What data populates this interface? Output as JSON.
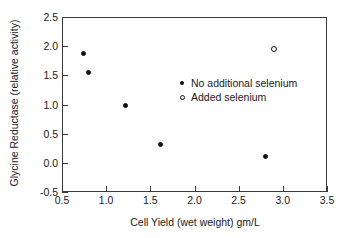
{
  "chart_data": {
    "type": "scatter",
    "title": "",
    "xlabel": "Cell Yield (wet weight) gm/L",
    "ylabel": "Glycine Reductase (relative activity)",
    "xlim": [
      0.5,
      3.5
    ],
    "ylim": [
      -0.5,
      2.5
    ],
    "xticks": [
      "0.5",
      "1.0",
      "1.5",
      "2.0",
      "2.5",
      "3.0",
      "3.5"
    ],
    "xtick_values": [
      0.5,
      1.0,
      1.5,
      2.0,
      2.5,
      3.0,
      3.5
    ],
    "yticks": [
      "-0.5",
      "0.0",
      "0.5",
      "1.0",
      "1.5",
      "2.0",
      "2.5"
    ],
    "ytick_values": [
      -0.5,
      0.0,
      0.5,
      1.0,
      1.5,
      2.0,
      2.5
    ],
    "grid": false,
    "legend_position": "center-right",
    "series": [
      {
        "name": "No additional selenium",
        "marker": "filled-circle",
        "color": "#111111",
        "points": [
          {
            "x": 0.74,
            "y": 1.87
          },
          {
            "x": 0.8,
            "y": 1.55
          },
          {
            "x": 1.22,
            "y": 0.98
          },
          {
            "x": 1.62,
            "y": 0.32
          },
          {
            "x": 2.8,
            "y": 0.11
          }
        ]
      },
      {
        "name": "Added selenium",
        "marker": "open-circle",
        "color": "#111111",
        "points": [
          {
            "x": 2.9,
            "y": 1.96
          }
        ]
      }
    ]
  },
  "legend": {
    "entries": [
      {
        "label": "No additional selenium",
        "marker": "filled-circle"
      },
      {
        "label": "Added selenium",
        "marker": "open-circle"
      }
    ]
  },
  "colors": {
    "axis": "#3a3a3a",
    "text": "#1a1a1a",
    "marker": "#111111",
    "background": "#ffffff"
  }
}
